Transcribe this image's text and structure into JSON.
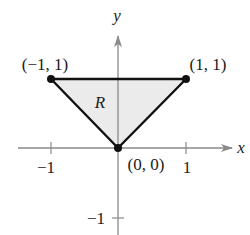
{
  "diagram": {
    "type": "coordinate-plane-region",
    "axes": {
      "x_label": "x",
      "y_label": "y",
      "x_ticks": [
        {
          "value": -1,
          "label": "−1"
        },
        {
          "value": 1,
          "label": "1"
        }
      ],
      "y_ticks": [
        {
          "value": -1,
          "label": "−1"
        }
      ]
    },
    "region": {
      "label": "R",
      "fill_color": "#ebebeb",
      "edge_color": "#111111",
      "vertices": [
        {
          "x": -1,
          "y": 1,
          "label": "(−1, 1)"
        },
        {
          "x": 1,
          "y": 1,
          "label": "(1, 1)"
        },
        {
          "x": 0,
          "y": 0,
          "label": "(0, 0)"
        }
      ]
    },
    "colors": {
      "axis": "#8a8a8a",
      "text": "#1a1a1a"
    }
  }
}
